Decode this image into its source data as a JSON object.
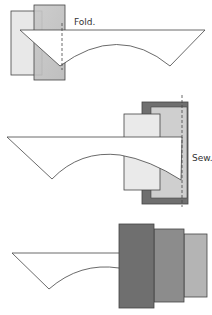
{
  "panels": [
    {
      "step": 1,
      "label": "Fold."
    },
    {
      "step": 2,
      "label": "Sew."
    },
    {
      "step": 3,
      "label": ""
    }
  ],
  "colors": {
    "light_fabric": "#e6e6e6",
    "mid_fabric": "#c4c4c4",
    "dark_fabric": "#6f6f6f",
    "medium_dark_fabric": "#8c8c8c",
    "light_gray_fabric": "#b4b4b4",
    "outline": "#444444"
  }
}
